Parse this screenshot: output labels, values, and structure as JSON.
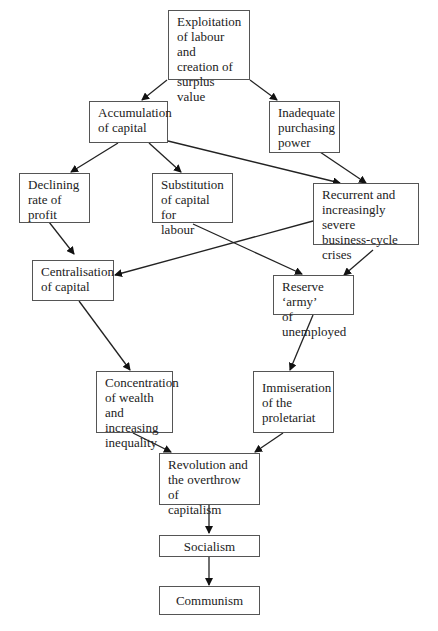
{
  "diagram": {
    "type": "flowchart",
    "nodes": {
      "exploitation": {
        "label": "Exploitation\nof labour and\ncreation of\nsurplus value"
      },
      "accumulation": {
        "label": "Accumulation\nof capital"
      },
      "purchasing": {
        "label": "Inadequate\npurchasing\npower"
      },
      "declining": {
        "label": "Declining\nrate of\nprofit"
      },
      "substitution": {
        "label": "Substitution\nof capital for\nlabour"
      },
      "recurrent": {
        "label": "Recurrent and\nincreasingly severe\nbusiness-cycle\ncrises"
      },
      "centralisation": {
        "label": "Centralisation\nof capital"
      },
      "reserve": {
        "label": "Reserve ‘army’\nof unemployed"
      },
      "concentration": {
        "label": "Concentration\nof wealth and\nincreasing\ninequality"
      },
      "immiseration": {
        "label": "Immiseration\nof the\nproletariat"
      },
      "revolution": {
        "label": "Revolution and\nthe overthrow of\ncapitalism"
      },
      "socialism": {
        "label": "Socialism"
      },
      "communism": {
        "label": "Communism"
      }
    },
    "edges": [
      [
        "exploitation",
        "accumulation"
      ],
      [
        "exploitation",
        "purchasing"
      ],
      [
        "accumulation",
        "declining"
      ],
      [
        "accumulation",
        "substitution"
      ],
      [
        "accumulation",
        "recurrent"
      ],
      [
        "purchasing",
        "recurrent"
      ],
      [
        "declining",
        "centralisation"
      ],
      [
        "recurrent",
        "centralisation"
      ],
      [
        "substitution",
        "reserve"
      ],
      [
        "recurrent",
        "reserve"
      ],
      [
        "centralisation",
        "concentration"
      ],
      [
        "reserve",
        "immiseration"
      ],
      [
        "concentration",
        "revolution"
      ],
      [
        "immiseration",
        "revolution"
      ],
      [
        "revolution",
        "socialism"
      ],
      [
        "socialism",
        "communism"
      ]
    ]
  }
}
